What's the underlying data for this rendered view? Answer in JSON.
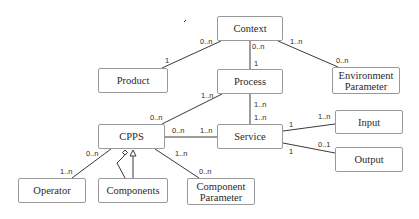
{
  "diagram": {
    "type": "UML class diagram",
    "nodes": {
      "context": "Context",
      "product": "Product",
      "process": "Process",
      "environment_parameter": "Environment Parameter",
      "cpps": "CPPS",
      "service": "Service",
      "input": "Input",
      "output": "Output",
      "operator": "Operator",
      "components": "Components",
      "component_parameter": "Component Parameter"
    },
    "edges": [
      {
        "from": "Context",
        "to": "Product",
        "from_mult": "0..n",
        "to_mult": "1"
      },
      {
        "from": "Context",
        "to": "Process",
        "from_mult": "0..n",
        "to_mult": "1"
      },
      {
        "from": "Context",
        "to": "Environment Parameter",
        "from_mult": "1..n",
        "to_mult": "0..n"
      },
      {
        "from": "Process",
        "to": "CPPS",
        "from_mult": "1..n",
        "to_mult": "0..n"
      },
      {
        "from": "Process",
        "to": "Service",
        "from_mult": "1..n",
        "to_mult": "1..n"
      },
      {
        "from": "CPPS",
        "to": "Service",
        "from_mult": "0..n",
        "to_mult": "1..n"
      },
      {
        "from": "Service",
        "to": "Input",
        "from_mult": "1",
        "to_mult": "1..n"
      },
      {
        "from": "Service",
        "to": "Output",
        "from_mult": "1",
        "to_mult": "0..1"
      },
      {
        "from": "CPPS",
        "to": "Operator",
        "from_mult": "0..n",
        "to_mult": "1..n"
      },
      {
        "from": "CPPS",
        "to": "Components",
        "relation": "aggregation + generalization"
      },
      {
        "from": "CPPS",
        "to": "Component Parameter",
        "from_mult": "1..n",
        "to_mult": "0..n"
      }
    ],
    "multiplicities": {
      "context_product_a": "0..n",
      "context_product_b": "1",
      "context_process_a": "0..n",
      "context_process_b": "1",
      "context_env_a": "1..n",
      "context_env_b": "0..n",
      "process_cpps_a": "1..n",
      "process_cpps_b": "0..n",
      "process_service_a": "1..n",
      "process_service_b": "1..n",
      "cpps_service_a": "0..n",
      "cpps_service_b": "1..n",
      "service_input_a": "1",
      "service_input_b": "1..n",
      "service_output_a": "1",
      "service_output_b": "0..1",
      "cpps_operator_a": "0..n",
      "cpps_operator_b": "1..n",
      "cpps_compparam_a": "1..n",
      "cpps_compparam_b": "0..n"
    },
    "colors": {
      "line": "#3a3a3a",
      "border": "#9a9a9a",
      "text": "#2a2a2a",
      "background": "#ffffff"
    }
  }
}
